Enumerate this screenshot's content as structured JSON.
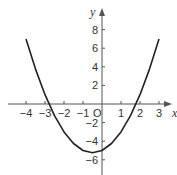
{
  "chart_data": {
    "type": "line",
    "title": "",
    "xlabel": "x",
    "ylabel": "y",
    "origin_label": "O",
    "xlim": [
      -4.6,
      3.9
    ],
    "ylim": [
      -7.5,
      10
    ],
    "grid": false,
    "x_ticks": [
      -4,
      -3,
      -2,
      -1,
      1,
      2,
      3
    ],
    "x_tick_labels": [
      "−4",
      "−3",
      "−2",
      "−1",
      "1",
      "2",
      "3"
    ],
    "y_ticks": [
      8,
      6,
      4,
      2,
      -2,
      -4,
      -6
    ],
    "y_tick_labels": [
      "8",
      "6",
      "4",
      "2",
      "−2",
      "−4",
      "−6"
    ],
    "series": [
      {
        "name": "parabola (fitted; not labeled in image)",
        "x_range": [
          -4,
          3
        ],
        "x": [
          -4,
          -3.5,
          -3,
          -2.5,
          -2,
          -1.5,
          -1,
          -0.5,
          0,
          0.5,
          1,
          1.5,
          2,
          2.5,
          3
        ],
        "y": [
          7,
          3.75,
          1,
          -1.25,
          -3,
          -4.25,
          -5,
          -5.25,
          -5,
          -4.25,
          -3,
          -1.25,
          1,
          3.75,
          7
        ]
      }
    ],
    "annotations": [
      "Curve values are an estimate read off the plot geometry; no equation or data labels appear in the figure."
    ]
  },
  "colors": {
    "axis": "#555555",
    "curve": "#222222",
    "background": "#ffffff"
  }
}
